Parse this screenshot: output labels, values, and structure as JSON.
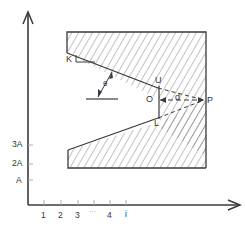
{
  "diagram": {
    "axes": {
      "y_ticks": [
        {
          "label": "3A",
          "y": 145
        },
        {
          "label": "2A",
          "y": 164
        },
        {
          "label": "A",
          "y": 180
        }
      ],
      "x_ticks": [
        {
          "label": "1",
          "x": 44
        },
        {
          "label": "2",
          "x": 61
        },
        {
          "label": "3",
          "x": 78
        },
        {
          "label": "···",
          "x": 94
        },
        {
          "label": "4",
          "x": 110
        },
        {
          "label": "i",
          "x": 126
        }
      ]
    },
    "points": {
      "K": "K",
      "theta": "θ",
      "U": "U",
      "O": "O",
      "d": "d",
      "P": "P",
      "L": "L"
    },
    "colors": {
      "line": "#3a3a3a",
      "hatch": "#555555",
      "background": "#ffffff"
    }
  }
}
